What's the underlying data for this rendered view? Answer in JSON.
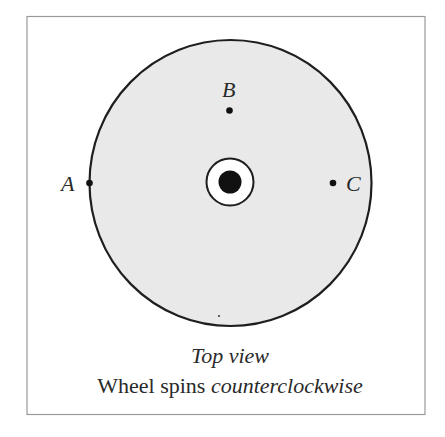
{
  "diagram": {
    "points": [
      {
        "id": "A",
        "label": "A"
      },
      {
        "id": "B",
        "label": "B"
      },
      {
        "id": "C",
        "label": "C"
      }
    ],
    "caption": {
      "line1": "Top view",
      "line2_normal": "Wheel spins ",
      "line2_italic": "counterclockwise"
    },
    "colors": {
      "wheel_fill": "#ececec",
      "stroke": "#1e1e1e",
      "frame": "#9a9a9a"
    }
  }
}
